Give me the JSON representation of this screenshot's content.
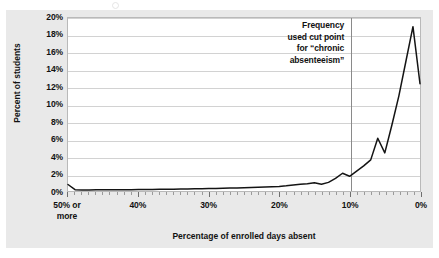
{
  "figure": {
    "background_color": "#e9e9e9",
    "plot_background_color": "#ffffff",
    "plot_border_color": "#b9b9b9",
    "gridline_color": "#d2d2d2",
    "line_color": "#141414",
    "cut_line_color": "#8a8a8a"
  },
  "annotation": {
    "text": "Frequency\nused cut point\nfor “chronic\nabsenteeism”",
    "at_x_percent": 10
  },
  "chart_data": {
    "type": "line",
    "title": "",
    "subtitle": "",
    "xlabel": "Percentage of enrolled days absent",
    "ylabel": "Percent of students",
    "grid": true,
    "legend": null,
    "x_axis_reversed": true,
    "xlim": [
      0,
      50
    ],
    "ylim": [
      0,
      20
    ],
    "y_ticks": [
      0,
      2,
      4,
      6,
      8,
      10,
      12,
      14,
      16,
      18,
      20
    ],
    "y_tick_labels": [
      "0%",
      "2%",
      "4%",
      "6%",
      "8%",
      "10%",
      "12%",
      "14%",
      "16%",
      "18%",
      "20%"
    ],
    "x_ticks": [
      50,
      40,
      30,
      20,
      10,
      0
    ],
    "x_tick_labels": [
      "50% or\nmore",
      "40%",
      "30%",
      "20%",
      "10%",
      "0%"
    ],
    "x_minor_tick_interval": 1,
    "annotations": [
      {
        "type": "vline",
        "x": 10,
        "label": "Frequency used cut point for “chronic absenteeism”"
      }
    ],
    "x": [
      50,
      49,
      48,
      47,
      46,
      45,
      44,
      43,
      42,
      41,
      40,
      39,
      38,
      37,
      36,
      35,
      34,
      33,
      32,
      31,
      30,
      29,
      28,
      27,
      26,
      25,
      24,
      23,
      22,
      21,
      20,
      19,
      18,
      17,
      16,
      15,
      14,
      13,
      12,
      11,
      10,
      9,
      8,
      7,
      6,
      5,
      4,
      3,
      2,
      1,
      0
    ],
    "values": [
      0.75,
      0.15,
      0.12,
      0.12,
      0.13,
      0.13,
      0.14,
      0.14,
      0.15,
      0.15,
      0.16,
      0.17,
      0.18,
      0.19,
      0.2,
      0.21,
      0.22,
      0.23,
      0.25,
      0.26,
      0.28,
      0.3,
      0.32,
      0.34,
      0.36,
      0.38,
      0.4,
      0.42,
      0.45,
      0.48,
      0.52,
      0.6,
      0.7,
      0.78,
      0.85,
      0.95,
      0.78,
      1.0,
      1.45,
      2.05,
      1.7,
      2.3,
      2.9,
      3.6,
      6.1,
      4.4,
      7.6,
      11.0,
      15.0,
      19.0,
      12.4
    ]
  },
  "x_axis": {
    "labels": [
      {
        "text": "50% or\nmore",
        "value": 50
      },
      {
        "text": "40%",
        "value": 40
      },
      {
        "text": "30%",
        "value": 30
      },
      {
        "text": "20%",
        "value": 20
      },
      {
        "text": "10%",
        "value": 10
      },
      {
        "text": "0%",
        "value": 0
      }
    ],
    "title": "Percentage of enrolled days absent"
  },
  "y_axis": {
    "labels": [
      "20%",
      "18%",
      "16%",
      "14%",
      "12%",
      "10%",
      "8%",
      "6%",
      "4%",
      "2%",
      "0%"
    ],
    "title": "Percent of students"
  }
}
